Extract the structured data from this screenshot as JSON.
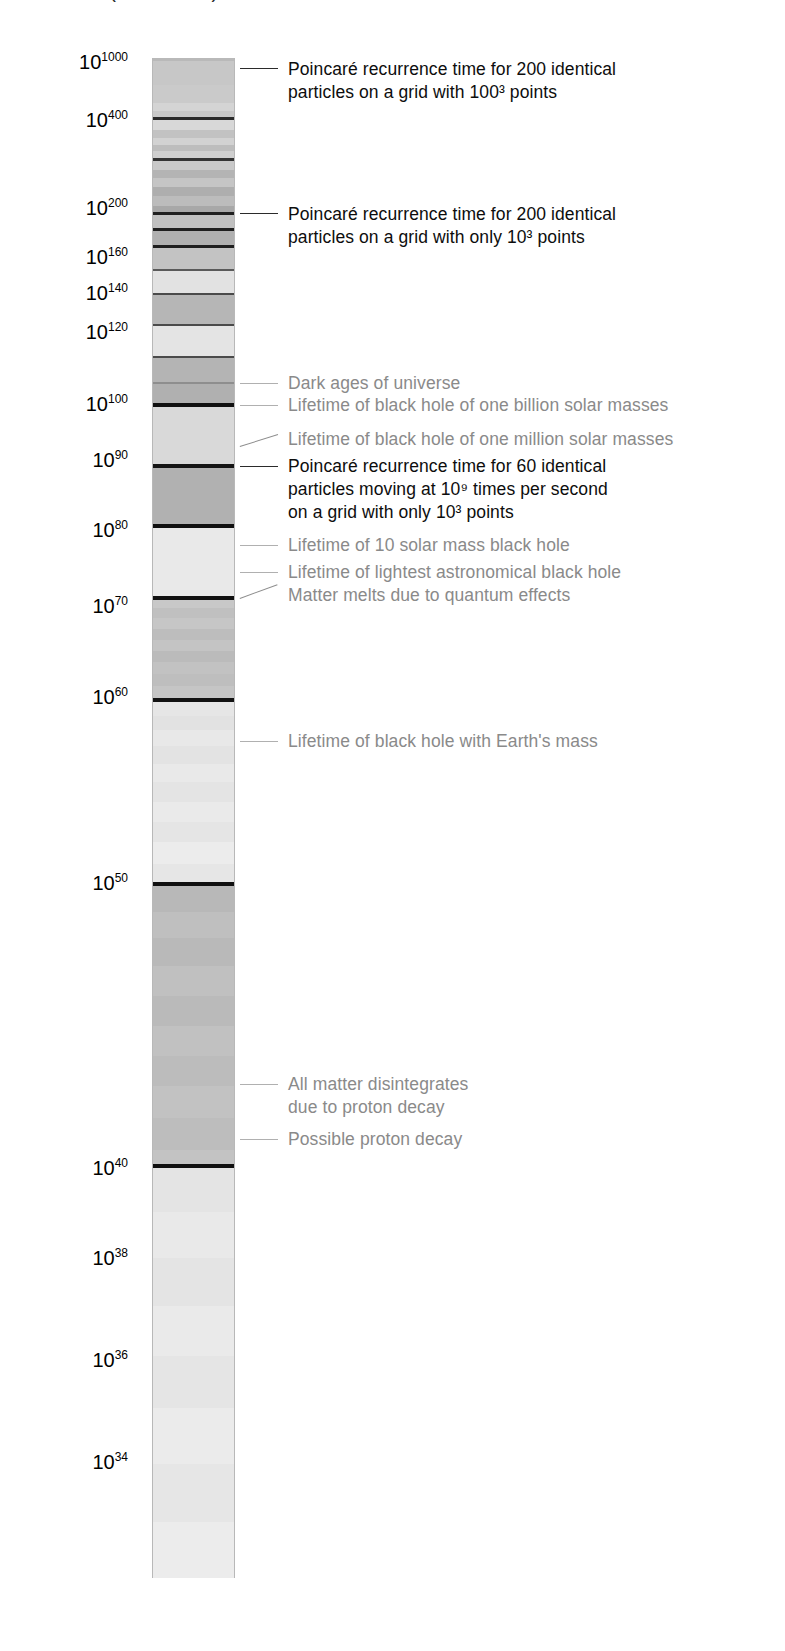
{
  "figure": {
    "title_partial": "Time (in seconds)",
    "bar": {
      "x": 152,
      "y": 58,
      "width": 83,
      "height": 1520,
      "border_color": "#b8b8b8"
    }
  },
  "axis": {
    "label": "Time (in seconds)",
    "scale": "logarithmic",
    "ticks": [
      {
        "base": "10",
        "exponent": "1000",
        "y": 52
      },
      {
        "base": "10",
        "exponent": "400",
        "y": 110
      },
      {
        "base": "10",
        "exponent": "200",
        "y": 198
      },
      {
        "base": "10",
        "exponent": "160",
        "y": 247
      },
      {
        "base": "10",
        "exponent": "140",
        "y": 283
      },
      {
        "base": "10",
        "exponent": "120",
        "y": 322
      },
      {
        "base": "10",
        "exponent": "100",
        "y": 394
      },
      {
        "base": "10",
        "exponent": "90",
        "y": 450
      },
      {
        "base": "10",
        "exponent": "80",
        "y": 520
      },
      {
        "base": "10",
        "exponent": "70",
        "y": 596
      },
      {
        "base": "10",
        "exponent": "60",
        "y": 687
      },
      {
        "base": "10",
        "exponent": "50",
        "y": 873
      },
      {
        "base": "10",
        "exponent": "40",
        "y": 1158
      },
      {
        "base": "10",
        "exponent": "38",
        "y": 1248
      },
      {
        "base": "10",
        "exponent": "36",
        "y": 1350
      },
      {
        "base": "10",
        "exponent": "34",
        "y": 1452
      }
    ]
  },
  "annotations": [
    {
      "id": "poincare-200-100cubed",
      "style": "dark",
      "text": "Poincaré recurrence time for 200 identical\nparticles on a grid with 100³ points",
      "leader": {
        "y": 68,
        "x1": 240,
        "x2": 278,
        "kind": "dark"
      },
      "text_x": 288,
      "text_y": 58
    },
    {
      "id": "poincare-200-10cubed",
      "style": "dark",
      "text": "Poincaré recurrence time for 200 identical\nparticles on a grid with only 10³ points",
      "leader": {
        "y": 213,
        "x1": 240,
        "x2": 278,
        "kind": "dark"
      },
      "text_x": 288,
      "text_y": 203
    },
    {
      "id": "dark-ages-of-universe",
      "style": "grey",
      "text": "Dark ages of universe",
      "leader": {
        "y": 383,
        "x1": 240,
        "x2": 278,
        "kind": "light"
      },
      "text_x": 288,
      "text_y": 372
    },
    {
      "id": "lifetime-bh-one-billion-solar-masses",
      "style": "grey",
      "text": "Lifetime of black hole of one billion solar masses",
      "leader": {
        "y": 405,
        "x1": 240,
        "x2": 278,
        "kind": "light"
      },
      "text_x": 288,
      "text_y": 394
    },
    {
      "id": "lifetime-bh-one-million-solar-masses",
      "style": "grey",
      "text": "Lifetime of black hole of one million solar masses",
      "leader": {
        "y": 446,
        "x1": 240,
        "x2": 278,
        "kind": "slant",
        "slope": -12
      },
      "text_x": 288,
      "text_y": 428
    },
    {
      "id": "poincare-60-particles",
      "style": "dark",
      "text": "Poincaré recurrence time for 60 identical\nparticles moving at 10⁹ times per second\non a grid with only 10³ points",
      "leader": {
        "y": 466,
        "x1": 240,
        "x2": 278,
        "kind": "dark"
      },
      "text_x": 288,
      "text_y": 455
    },
    {
      "id": "lifetime-10-solar-mass-bh",
      "style": "grey",
      "text": "Lifetime of 10 solar mass black hole",
      "leader": {
        "y": 545,
        "x1": 240,
        "x2": 278,
        "kind": "light"
      },
      "text_x": 288,
      "text_y": 534
    },
    {
      "id": "lifetime-lightest-astronomical-bh",
      "style": "grey",
      "text": "Lifetime of lightest astronomical black hole",
      "leader": {
        "y": 572,
        "x1": 240,
        "x2": 278,
        "kind": "light"
      },
      "text_x": 288,
      "text_y": 561
    },
    {
      "id": "matter-melts-quantum-effects",
      "style": "grey",
      "text": "Matter melts due to quantum effects",
      "leader": {
        "y": 598,
        "x1": 240,
        "x2": 278,
        "kind": "slant",
        "slope": -14
      },
      "text_x": 288,
      "text_y": 584
    },
    {
      "id": "lifetime-bh-earth-mass",
      "style": "grey",
      "text": "Lifetime of  black hole with Earth's mass",
      "leader": {
        "y": 741,
        "x1": 240,
        "x2": 278,
        "kind": "light"
      },
      "text_x": 288,
      "text_y": 730
    },
    {
      "id": "all-matter-disintegrates",
      "style": "grey",
      "text": "All matter disintegrates\ndue to proton decay",
      "leader": {
        "y": 1084,
        "x1": 240,
        "x2": 278,
        "kind": "light"
      },
      "text_x": 288,
      "text_y": 1073
    },
    {
      "id": "possible-proton-decay",
      "style": "grey",
      "text": "Possible proton decay",
      "leader": {
        "y": 1139,
        "x1": 240,
        "x2": 278,
        "kind": "light"
      },
      "text_x": 288,
      "text_y": 1128
    }
  ],
  "chart_data": {
    "type": "bar",
    "orientation": "vertical",
    "title": "Time (in seconds)",
    "xlabel": "",
    "ylabel": "Time (in seconds)",
    "axis_scale": "log10",
    "ylim_exponents": [
      34,
      1000
    ],
    "grid": false,
    "legend": "none",
    "tick_exponents": [
      1000,
      400,
      200,
      160,
      140,
      120,
      100,
      90,
      80,
      70,
      60,
      50,
      40,
      38,
      36,
      34
    ],
    "events": [
      {
        "label": "Poincaré recurrence time for 200 identical particles on a grid with 100³ points",
        "exponent_approx": 1000,
        "emphasis": "high"
      },
      {
        "label": "Poincaré recurrence time for 200 identical particles on a grid with only 10³ points",
        "exponent_approx": 200,
        "emphasis": "high"
      },
      {
        "label": "Dark ages of universe",
        "exponent_approx": 106,
        "emphasis": "low"
      },
      {
        "label": "Lifetime of black hole of one billion solar masses",
        "exponent_approx": 100,
        "emphasis": "low"
      },
      {
        "label": "Lifetime of black hole of one million solar masses",
        "exponent_approx": 94,
        "emphasis": "low"
      },
      {
        "label": "Poincaré recurrence time for 60 identical particles moving at 10⁹ times per second on a grid with only 10³ points",
        "exponent_approx": 90,
        "emphasis": "high"
      },
      {
        "label": "Lifetime of 10 solar mass black hole",
        "exponent_approx": 78,
        "emphasis": "low"
      },
      {
        "label": "Lifetime of lightest astronomical black hole",
        "exponent_approx": 74,
        "emphasis": "low"
      },
      {
        "label": "Matter melts due to quantum effects",
        "exponent_approx": 71,
        "emphasis": "low"
      },
      {
        "label": "Lifetime of  black hole with Earth's mass",
        "exponent_approx": 57,
        "emphasis": "low"
      },
      {
        "label": "All matter disintegrates due to proton decay",
        "exponent_approx": 44,
        "emphasis": "low"
      },
      {
        "label": "Possible proton decay",
        "exponent_approx": 42,
        "emphasis": "low"
      }
    ],
    "bands": [
      {
        "y": 58,
        "h": 3,
        "fill": "#b9b9b9",
        "rule": "heavy"
      },
      {
        "y": 61,
        "h": 24,
        "fill": "#c7c7c7"
      },
      {
        "y": 85,
        "h": 18,
        "fill": "#cacaca"
      },
      {
        "y": 103,
        "h": 8,
        "fill": "#d4d4d4"
      },
      {
        "y": 111,
        "h": 6,
        "fill": "#c8c8c8"
      },
      {
        "y": 117,
        "h": 3,
        "fill": "#2a2a2a",
        "rule": "heavy"
      },
      {
        "y": 120,
        "h": 10,
        "fill": "#d8d8d8"
      },
      {
        "y": 130,
        "h": 8,
        "fill": "#c2c2c2"
      },
      {
        "y": 138,
        "h": 7,
        "fill": "#d2d2d2"
      },
      {
        "y": 145,
        "h": 6,
        "fill": "#bdbdbd"
      },
      {
        "y": 151,
        "h": 7,
        "fill": "#cfcfcf"
      },
      {
        "y": 158,
        "h": 3,
        "fill": "#333333",
        "rule": "heavy"
      },
      {
        "y": 161,
        "h": 9,
        "fill": "#c9c9c9"
      },
      {
        "y": 170,
        "h": 8,
        "fill": "#b4b4b4"
      },
      {
        "y": 178,
        "h": 9,
        "fill": "#c5c5c5"
      },
      {
        "y": 187,
        "h": 9,
        "fill": "#aeaeae"
      },
      {
        "y": 196,
        "h": 10,
        "fill": "#bcbcbc"
      },
      {
        "y": 206,
        "h": 6,
        "fill": "#a8a8a8"
      },
      {
        "y": 212,
        "h": 3,
        "fill": "#1f1f1f",
        "rule": "heavy"
      },
      {
        "y": 215,
        "h": 13,
        "fill": "#c0c0c0"
      },
      {
        "y": 228,
        "h": 3,
        "fill": "#1f1f1f",
        "rule": "heavy"
      },
      {
        "y": 231,
        "h": 14,
        "fill": "#b0b0b0"
      },
      {
        "y": 245,
        "h": 3,
        "fill": "#1f1f1f",
        "rule": "heavy"
      },
      {
        "y": 248,
        "h": 21,
        "fill": "#c3c3c3"
      },
      {
        "y": 269,
        "h": 2,
        "fill": "#5a5a5a",
        "rule": "heavy"
      },
      {
        "y": 271,
        "h": 22,
        "fill": "#e2e2e2"
      },
      {
        "y": 293,
        "h": 2,
        "fill": "#4a4a4a",
        "rule": "heavy"
      },
      {
        "y": 295,
        "h": 29,
        "fill": "#b6b6b6"
      },
      {
        "y": 324,
        "h": 2,
        "fill": "#4a4a4a",
        "rule": "heavy"
      },
      {
        "y": 326,
        "h": 30,
        "fill": "#e4e4e4"
      },
      {
        "y": 356,
        "h": 2,
        "fill": "#4a4a4a",
        "rule": "heavy"
      },
      {
        "y": 358,
        "h": 24,
        "fill": "#b4b4b4"
      },
      {
        "y": 382,
        "h": 2,
        "fill": "#8e8e8e",
        "rule": "light"
      },
      {
        "y": 384,
        "h": 19,
        "fill": "#b0b0b0"
      },
      {
        "y": 403,
        "h": 4,
        "fill": "#101010",
        "rule": "heavy"
      },
      {
        "y": 407,
        "h": 57,
        "fill": "#d9d9d9"
      },
      {
        "y": 464,
        "h": 4,
        "fill": "#151515",
        "rule": "heavy"
      },
      {
        "y": 468,
        "h": 56,
        "fill": "#b1b1b1"
      },
      {
        "y": 524,
        "h": 4,
        "fill": "#101010",
        "rule": "heavy"
      },
      {
        "y": 528,
        "h": 68,
        "fill": "#e9e9e9"
      },
      {
        "y": 596,
        "h": 4,
        "fill": "#111111",
        "rule": "heavy"
      },
      {
        "y": 600,
        "h": 8,
        "fill": "#c8c8c8"
      },
      {
        "y": 608,
        "h": 10,
        "fill": "#c0c0c0"
      },
      {
        "y": 618,
        "h": 11,
        "fill": "#c6c6c6"
      },
      {
        "y": 629,
        "h": 11,
        "fill": "#bdbdbd"
      },
      {
        "y": 640,
        "h": 11,
        "fill": "#c4c4c4"
      },
      {
        "y": 651,
        "h": 11,
        "fill": "#bbbbbb"
      },
      {
        "y": 662,
        "h": 12,
        "fill": "#c2c2c2"
      },
      {
        "y": 674,
        "h": 12,
        "fill": "#bebebe"
      },
      {
        "y": 686,
        "h": 12,
        "fill": "#c5c5c5"
      },
      {
        "y": 698,
        "h": 4,
        "fill": "#121212",
        "rule": "heavy"
      },
      {
        "y": 702,
        "h": 14,
        "fill": "#e6e6e6"
      },
      {
        "y": 716,
        "h": 14,
        "fill": "#e2e2e2"
      },
      {
        "y": 730,
        "h": 16,
        "fill": "#e8e8e8"
      },
      {
        "y": 746,
        "h": 18,
        "fill": "#e3e3e3"
      },
      {
        "y": 764,
        "h": 18,
        "fill": "#e9e9e9"
      },
      {
        "y": 782,
        "h": 20,
        "fill": "#e4e4e4"
      },
      {
        "y": 802,
        "h": 20,
        "fill": "#eaeaea"
      },
      {
        "y": 822,
        "h": 20,
        "fill": "#e5e5e5"
      },
      {
        "y": 842,
        "h": 22,
        "fill": "#ececec"
      },
      {
        "y": 864,
        "h": 18,
        "fill": "#e6e6e6"
      },
      {
        "y": 882,
        "h": 4,
        "fill": "#101010",
        "rule": "heavy"
      },
      {
        "y": 886,
        "h": 26,
        "fill": "#b8b8b8"
      },
      {
        "y": 912,
        "h": 26,
        "fill": "#bfbfbf"
      },
      {
        "y": 938,
        "h": 28,
        "fill": "#b9b9b9"
      },
      {
        "y": 966,
        "h": 30,
        "fill": "#c0c0c0"
      },
      {
        "y": 996,
        "h": 30,
        "fill": "#bababa"
      },
      {
        "y": 1026,
        "h": 30,
        "fill": "#c1c1c1"
      },
      {
        "y": 1056,
        "h": 30,
        "fill": "#bcbcbc"
      },
      {
        "y": 1086,
        "h": 32,
        "fill": "#c2c2c2"
      },
      {
        "y": 1118,
        "h": 32,
        "fill": "#bdbdbd"
      },
      {
        "y": 1150,
        "h": 14,
        "fill": "#c3c3c3"
      },
      {
        "y": 1164,
        "h": 4,
        "fill": "#101010",
        "rule": "heavy"
      },
      {
        "y": 1168,
        "h": 44,
        "fill": "#e4e4e4"
      },
      {
        "y": 1212,
        "h": 46,
        "fill": "#e9e9e9"
      },
      {
        "y": 1258,
        "h": 48,
        "fill": "#e4e4e4"
      },
      {
        "y": 1306,
        "h": 50,
        "fill": "#eaeaea"
      },
      {
        "y": 1356,
        "h": 52,
        "fill": "#e5e5e5"
      },
      {
        "y": 1408,
        "h": 56,
        "fill": "#ebebeb"
      },
      {
        "y": 1464,
        "h": 58,
        "fill": "#e6e6e6"
      },
      {
        "y": 1522,
        "h": 56,
        "fill": "#ececec"
      }
    ]
  }
}
